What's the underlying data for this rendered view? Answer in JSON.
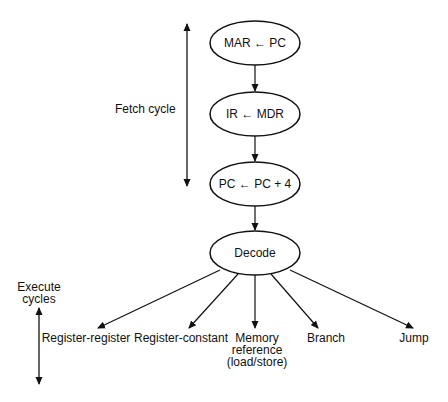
{
  "diagram": {
    "type": "flowchart",
    "nodes": [
      {
        "id": "mar",
        "label": "MAR ← PC"
      },
      {
        "id": "ir",
        "label": "IR ← MDR"
      },
      {
        "id": "pc",
        "label": "PC ← PC + 4"
      },
      {
        "id": "decode",
        "label": "Decode"
      }
    ],
    "branches": [
      {
        "id": "reg-reg",
        "label": "Register-register"
      },
      {
        "id": "reg-const",
        "label": "Register-constant"
      },
      {
        "id": "mem-ref",
        "line1": "Memory",
        "line2": "reference",
        "line3": "(load/store)"
      },
      {
        "id": "branch",
        "label": "Branch"
      },
      {
        "id": "jump",
        "label": "Jump"
      }
    ],
    "side_labels": {
      "fetch": "Fetch cycle",
      "execute_line1": "Execute",
      "execute_line2": "cycles"
    }
  }
}
